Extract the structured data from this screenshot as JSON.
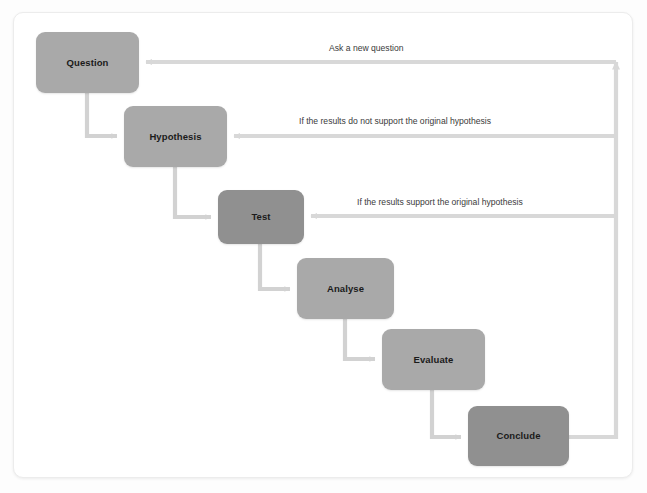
{
  "diagram": {
    "type": "flowchart",
    "canvas": {
      "width": 647,
      "height": 493
    },
    "colors": {
      "node_fill_light": "#a9a9a9",
      "node_fill_dark": "#909090",
      "connector": "#d2d2d2",
      "feedback_connector": "#d8d8d8",
      "text": "#1b1b1b",
      "edge_label_text": "#3a3a3a",
      "card_background": "#ffffff",
      "card_border": "#ececec",
      "page_background": "#fdfdfd"
    },
    "nodes": [
      {
        "id": "question",
        "label": "Question",
        "x": 36,
        "y": 32,
        "w": 103,
        "h": 61,
        "shade": "light"
      },
      {
        "id": "hypothesis",
        "label": "Hypothesis",
        "x": 124,
        "y": 106,
        "w": 103,
        "h": 61,
        "shade": "light"
      },
      {
        "id": "test",
        "label": "Test",
        "x": 218,
        "y": 190,
        "w": 86,
        "h": 54,
        "shade": "dark"
      },
      {
        "id": "analyse",
        "label": "Analyse",
        "x": 297,
        "y": 258,
        "w": 97,
        "h": 61,
        "shade": "light"
      },
      {
        "id": "evaluate",
        "label": "Evaluate",
        "x": 382,
        "y": 329,
        "w": 103,
        "h": 61,
        "shade": "light"
      },
      {
        "id": "conclude",
        "label": "Conclude",
        "x": 468,
        "y": 406,
        "w": 101,
        "h": 60,
        "shade": "dark"
      }
    ],
    "forward_edges": [
      {
        "id": "question-to-hypothesis",
        "from": "question",
        "to": "hypothesis"
      },
      {
        "id": "hypothesis-to-test",
        "from": "hypothesis",
        "to": "test"
      },
      {
        "id": "test-to-analyse",
        "from": "test",
        "to": "analyse"
      },
      {
        "id": "analyse-to-evaluate",
        "from": "analyse",
        "to": "evaluate"
      },
      {
        "id": "evaluate-to-conclude",
        "from": "evaluate",
        "to": "conclude"
      }
    ],
    "feedback_edges": [
      {
        "id": "feedback-new-question",
        "label": "Ask a new question",
        "from": "conclude",
        "to": "question",
        "label_x": 329,
        "label_y": 44,
        "line_y": 62
      },
      {
        "id": "feedback-not-supported",
        "label": "If the results do not support the original hypothesis",
        "from": "conclude",
        "to": "hypothesis",
        "label_x": 299,
        "label_y": 117,
        "line_y": 136
      },
      {
        "id": "feedback-supported",
        "label": "If the results support the original hypothesis",
        "from": "conclude",
        "to": "test",
        "label_x": 357,
        "label_y": 198,
        "line_y": 216
      }
    ],
    "return_bus": {
      "x": 616,
      "bottom_y": 440,
      "top_y": 58
    }
  }
}
